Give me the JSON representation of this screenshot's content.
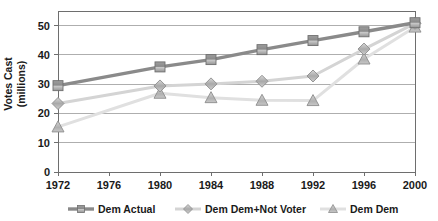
{
  "chart_data": {
    "type": "line",
    "title": "",
    "xlabel": "",
    "ylabel_line1": "Votes Cast",
    "ylabel_line2": "(millions)",
    "categories": [
      "1972",
      "1976",
      "1980",
      "1984",
      "1988",
      "1992",
      "1996",
      "2000"
    ],
    "x": [
      1972,
      1976,
      1980,
      1984,
      1988,
      1992,
      1996,
      2000
    ],
    "ylim": [
      0,
      55
    ],
    "yticks": [
      "0",
      "10",
      "20",
      "30",
      "40",
      "50"
    ],
    "ytick_values": [
      0,
      10,
      20,
      30,
      40,
      50
    ],
    "xlim": [
      1972,
      2000
    ],
    "grid": "horizontal",
    "legend_position": "bottom",
    "series": [
      {
        "name": "Dem Actual",
        "marker": "square",
        "color": "#8a8a8a",
        "line_color": "#8a8a8a",
        "x": [
          1972,
          1980,
          1984,
          1988,
          1992,
          1996,
          2000
        ],
        "values": [
          29.5,
          35.9,
          38.4,
          41.8,
          44.9,
          47.9,
          51.0
        ]
      },
      {
        "name": "Dem Dem+Not Voter",
        "marker": "diamond",
        "color": "#b3b3b3",
        "line_color": "#d4d4d4",
        "x": [
          1972,
          1980,
          1984,
          1988,
          1992,
          1996,
          2000
        ],
        "values": [
          23.4,
          29.4,
          30.1,
          31.0,
          32.8,
          42.0,
          50.8
        ]
      },
      {
        "name": "Dem Dem",
        "marker": "triangle",
        "color": "#a8a8a8",
        "line_color": "#e0e0e0",
        "x": [
          1972,
          1980,
          1984,
          1988,
          1992,
          1996,
          2000
        ],
        "values": [
          15.4,
          26.9,
          25.4,
          24.5,
          24.4,
          38.6,
          49.5
        ]
      }
    ]
  },
  "legend": {
    "items": [
      {
        "label": "Dem Actual",
        "marker": "square-marker-icon"
      },
      {
        "label": "Dem Dem+Not Voter",
        "marker": "diamond-marker-icon"
      },
      {
        "label": "Dem Dem",
        "marker": "triangle-marker-icon"
      }
    ]
  },
  "colors": {
    "series1": "#8a8a8a",
    "series2": "#d4d4d4",
    "series3": "#e4e4e4",
    "axis": "#6e6e6e",
    "grid": "#9a9a9a",
    "text": "#1a1a1a"
  }
}
